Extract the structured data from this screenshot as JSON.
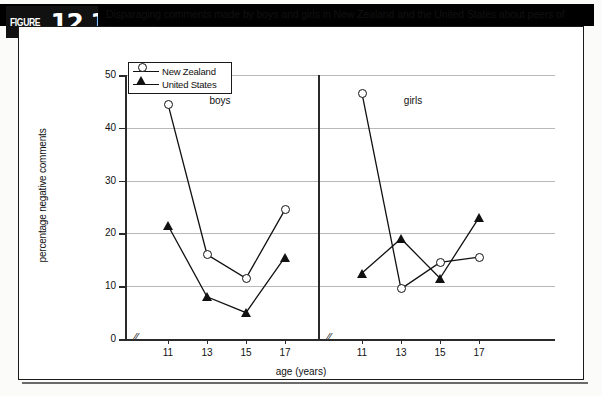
{
  "figure": {
    "label_word": "FIGURE",
    "number": "12.15",
    "caption": "Disparaging comments made by boys and girls in New Zealand and the United States about peers of the opposite sex"
  },
  "legend": {
    "items": [
      {
        "name": "New Zealand",
        "marker": "open-circle"
      },
      {
        "name": "United States",
        "marker": "filled-triangle"
      }
    ]
  },
  "panels": [
    {
      "title": "boys"
    },
    {
      "title": "girls"
    }
  ],
  "axis": {
    "y_title": "percentage negative comments",
    "y_ticks": [
      "0",
      "10",
      "20",
      "30",
      "40",
      "50"
    ],
    "x_title": "age (years)",
    "x_ticks": [
      "11",
      "13",
      "15",
      "17"
    ],
    "break_glyph": "//"
  },
  "chart_data": {
    "type": "line",
    "title": "Disparaging comments made by boys and girls in New Zealand and the United States about peers of the opposite sex",
    "xlabel": "age (years)",
    "ylabel": "percentage negative comments",
    "ylim": [
      0,
      50
    ],
    "yticks": [
      0,
      10,
      20,
      30,
      40,
      50
    ],
    "grid": true,
    "legend_position": "top-left",
    "x": [
      11,
      13,
      15,
      17
    ],
    "panels": [
      {
        "name": "boys",
        "series": [
          {
            "name": "New Zealand",
            "marker": "open-circle",
            "values": [
              44.5,
              16,
              11.5,
              24.5
            ]
          },
          {
            "name": "United States",
            "marker": "filled-triangle",
            "values": [
              21.5,
              8,
              5,
              15.5
            ]
          }
        ]
      },
      {
        "name": "girls",
        "series": [
          {
            "name": "New Zealand",
            "marker": "open-circle",
            "values": [
              46.5,
              9.5,
              14.5,
              15.5
            ]
          },
          {
            "name": "United States",
            "marker": "filled-triangle",
            "values": [
              12.5,
              19,
              11.5,
              23
            ]
          }
        ]
      }
    ]
  }
}
